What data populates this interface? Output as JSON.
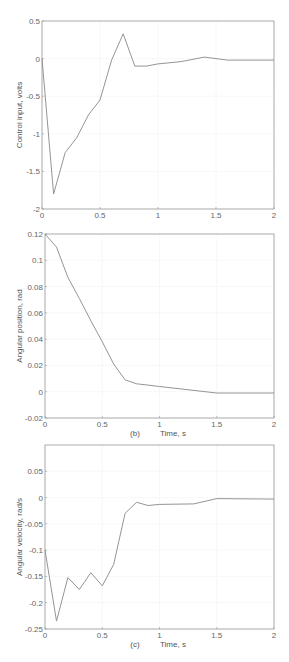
{
  "chart_data": [
    {
      "type": "line",
      "panel": "(a)",
      "title": "",
      "xlabel": "Time, s",
      "ylabel": "Control input, volts",
      "xlim": [
        0,
        2
      ],
      "ylim": [
        -2,
        0.5
      ],
      "xticks": [
        0,
        0.5,
        1,
        1.5,
        2
      ],
      "xtick_labels": [
        "0",
        "0.5",
        "1",
        "1.5",
        "2"
      ],
      "yticks": [
        -2,
        -1.5,
        -1,
        -0.5,
        0,
        0.5
      ],
      "ytick_labels": [
        "-2",
        "-1.5",
        "-1",
        "-0.5",
        "0",
        "0.5"
      ],
      "grid": true,
      "x": [
        0,
        0.1,
        0.2,
        0.3,
        0.4,
        0.5,
        0.6,
        0.7,
        0.8,
        0.9,
        1.0,
        1.2,
        1.4,
        1.6,
        2.0
      ],
      "y": [
        0,
        -1.8,
        -1.25,
        -1.05,
        -0.75,
        -0.55,
        -0.02,
        0.33,
        -0.1,
        -0.1,
        -0.07,
        -0.04,
        0.02,
        -0.02,
        -0.02
      ]
    },
    {
      "type": "line",
      "panel": "(b)",
      "title": "",
      "xlabel": "Time, s",
      "ylabel": "Angular position, rad",
      "xlim": [
        0,
        2
      ],
      "ylim": [
        -0.02,
        0.12
      ],
      "xticks": [
        0,
        0.5,
        1,
        1.5,
        2
      ],
      "xtick_labels": [
        "0",
        "0.5",
        "1",
        "1.5",
        "2"
      ],
      "yticks": [
        -0.02,
        0,
        0.02,
        0.04,
        0.06,
        0.08,
        0.1,
        0.12
      ],
      "ytick_labels": [
        "-0.02",
        "0",
        "0.02",
        "0.04",
        "0.06",
        "0.08",
        "0.1",
        "0.12"
      ],
      "grid": true,
      "x": [
        0,
        0.1,
        0.2,
        0.3,
        0.4,
        0.5,
        0.6,
        0.7,
        0.8,
        0.9,
        1.0,
        1.2,
        1.4,
        1.5,
        2.0
      ],
      "y": [
        0.12,
        0.11,
        0.087,
        0.071,
        0.054,
        0.038,
        0.021,
        0.009,
        0.006,
        0.005,
        0.004,
        0.002,
        0.0,
        -0.001,
        -0.001
      ]
    },
    {
      "type": "line",
      "panel": "(c)",
      "title": "",
      "xlabel": "Time, s",
      "ylabel": "Angular velocity, rad/s",
      "xlim": [
        0,
        2
      ],
      "ylim": [
        -0.25,
        0.1
      ],
      "xticks": [
        0,
        0.5,
        1,
        1.5,
        2
      ],
      "xtick_labels": [
        "0",
        "0.5",
        "1",
        "1.5",
        "2"
      ],
      "yticks": [
        -0.25,
        -0.2,
        -0.15,
        -0.1,
        -0.05,
        0,
        0.05
      ],
      "ytick_labels": [
        "-0.25",
        "-0.2",
        "-0.15",
        "-0.1",
        "-0.05",
        "0",
        "0.05"
      ],
      "grid": true,
      "x": [
        0,
        0.1,
        0.2,
        0.3,
        0.4,
        0.5,
        0.6,
        0.7,
        0.8,
        0.9,
        1.0,
        1.3,
        1.5,
        2.0
      ],
      "y": [
        -0.1,
        -0.235,
        -0.152,
        -0.175,
        -0.143,
        -0.168,
        -0.127,
        -0.03,
        -0.009,
        -0.015,
        -0.013,
        -0.012,
        -0.002,
        -0.003
      ]
    }
  ],
  "colors": {
    "line": "#888888",
    "axis": "#999999",
    "grid": "#e8e8e8",
    "text": "#555555"
  }
}
